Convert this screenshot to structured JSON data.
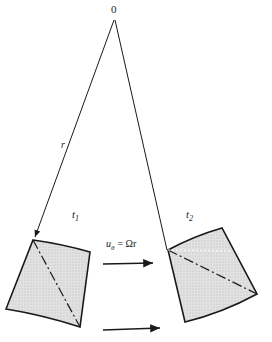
{
  "diagram": {
    "origin_label": "0",
    "radius_label": "r",
    "time1_label": "t",
    "time1_sub": "1",
    "time2_label": "t",
    "time2_sub": "2",
    "velocity_label_u": "u",
    "velocity_label_sub": "θ",
    "velocity_label_eq": "= Ωr",
    "colors": {
      "line": "#1a1a1a",
      "fill": "#d9d9d9"
    }
  }
}
